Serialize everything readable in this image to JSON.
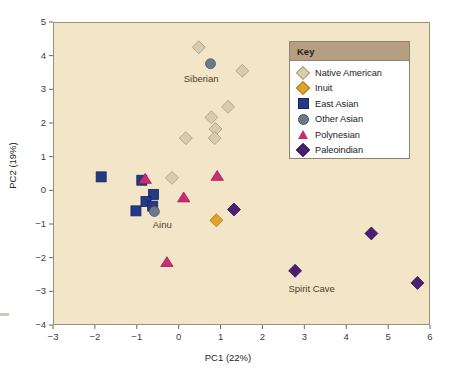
{
  "chart_data": {
    "type": "scatter",
    "title": "",
    "xlabel": "PC1 (22%)",
    "ylabel": "PC2 (19%)",
    "xlim": [
      -3,
      6
    ],
    "ylim": [
      -4,
      5
    ],
    "xticks": [
      "−3",
      "−2",
      "−1",
      "0",
      "1",
      "2",
      "3",
      "4",
      "5",
      "6"
    ],
    "yticks": [
      "5",
      "4",
      "3",
      "2",
      "1",
      "0",
      "−1",
      "−2",
      "−3",
      "−4"
    ],
    "grid": false,
    "legend_position": "top-right",
    "legend_title": "Key",
    "plot_background": "#f2e5c8",
    "series": [
      {
        "name": "Native American",
        "marker": "diamond",
        "color": "#d9cbb0",
        "edge": "#a79a7e",
        "points": [
          [
            0.48,
            4.25
          ],
          [
            1.52,
            3.55
          ],
          [
            1.18,
            2.48
          ],
          [
            0.78,
            2.17
          ],
          [
            0.88,
            1.82
          ],
          [
            0.86,
            1.55
          ],
          [
            0.17,
            1.55
          ],
          [
            -0.16,
            0.37
          ]
        ]
      },
      {
        "name": "Inuit",
        "marker": "diamond",
        "color": "#e0a42b",
        "edge": "#a8761a",
        "points": [
          [
            0.9,
            -0.89
          ]
        ]
      },
      {
        "name": "East Asian",
        "marker": "square",
        "color": "#253a86",
        "edge": "#16245c",
        "points": [
          [
            -1.85,
            0.4
          ],
          [
            -0.88,
            0.3
          ],
          [
            -0.6,
            -0.12
          ],
          [
            -0.78,
            -0.33
          ],
          [
            -0.62,
            -0.47
          ],
          [
            -1.02,
            -0.61
          ]
        ]
      },
      {
        "name": "Other Asian",
        "marker": "circle",
        "color": "#6b7a88",
        "edge": "#4d5a66",
        "points": [
          [
            0.76,
            3.76
          ],
          [
            -0.58,
            -0.63
          ]
        ]
      },
      {
        "name": "Polynesian",
        "marker": "triangle",
        "color": "#cc2d6f",
        "edge": "#a01f55",
        "points": [
          [
            -0.8,
            0.33
          ],
          [
            0.92,
            0.42
          ],
          [
            0.12,
            -0.22
          ],
          [
            -0.28,
            -2.14
          ]
        ]
      },
      {
        "name": "Paleoindian",
        "marker": "diamond",
        "color": "#4b1f73",
        "edge": "#33144f",
        "points": [
          [
            1.32,
            -0.57
          ],
          [
            4.6,
            -1.28
          ],
          [
            2.78,
            -2.39
          ],
          [
            5.7,
            -2.75
          ]
        ]
      }
    ],
    "annotations": [
      {
        "text": "Siberian",
        "x": 0.12,
        "y": 3.3
      },
      {
        "text": "Ainu",
        "x": -0.62,
        "y": -1.02
      },
      {
        "text": "Spirit Cave",
        "x": 2.62,
        "y": -2.92
      }
    ]
  }
}
